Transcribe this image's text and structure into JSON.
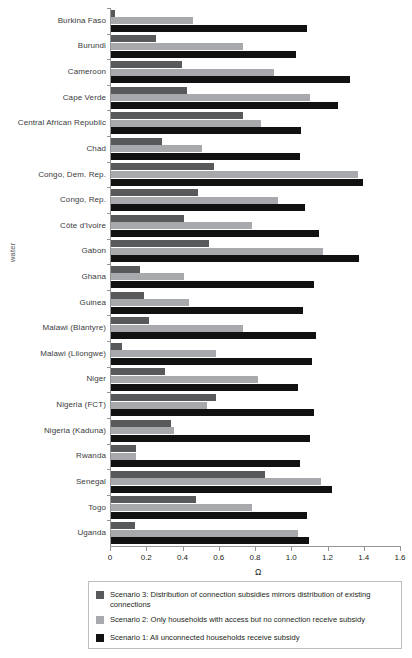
{
  "chart_data": {
    "type": "bar",
    "orientation": "horizontal",
    "grouped": true,
    "title": "",
    "xlabel": "Ω",
    "ylabel": "water",
    "xlim": [
      0,
      1.6
    ],
    "xticks": [
      0,
      0.2,
      0.4,
      0.6,
      0.8,
      1.0,
      1.2,
      1.4,
      1.6
    ],
    "xtick_labels": [
      "0",
      "0.2",
      "0.4",
      "0.6",
      "0.8",
      "1.0",
      "1.2",
      "1.4",
      "1.6"
    ],
    "grid": false,
    "legend_position": "bottom",
    "categories": [
      "Burkina Faso",
      "Burundi",
      "Cameroon",
      "Cape Verde",
      "Central African Republic",
      "Chad",
      "Congo, Dem. Rep.",
      "Congo, Rep.",
      "Côte d'Ivoire",
      "Gabon",
      "Ghana",
      "Guinea",
      "Malawi (Blantyre)",
      "Malawi (Lilongwe)",
      "Niger",
      "Nigeria (FCT)",
      "Nigeria (Kaduna)",
      "Rwanda",
      "Senegal",
      "Togo",
      "Uganda"
    ],
    "series": [
      {
        "name": "Scenario 3: Distribution of connection subsidies mirrors distribution of existing connections",
        "short_name": "Scenario 3",
        "color": "#58595b",
        "values": [
          0.02,
          0.25,
          0.39,
          0.42,
          0.73,
          0.28,
          0.57,
          0.48,
          0.4,
          0.54,
          0.16,
          0.18,
          0.21,
          0.06,
          0.3,
          0.58,
          0.33,
          0.14,
          0.85,
          0.47,
          0.13
        ]
      },
      {
        "name": "Scenario 2: Only households with access but no connection receive subsidy",
        "short_name": "Scenario 2",
        "color": "#a7a9ac",
        "values": [
          0.45,
          0.73,
          0.9,
          1.1,
          0.83,
          0.5,
          1.36,
          0.92,
          0.78,
          1.17,
          0.4,
          0.43,
          0.73,
          0.58,
          0.81,
          0.53,
          0.35,
          0.14,
          1.16,
          0.78,
          1.03
        ]
      },
      {
        "name": "Scenario 1: All unconnected households receive subsidy",
        "short_name": "Scenario 1",
        "color": "#111111",
        "values": [
          1.08,
          1.02,
          1.32,
          1.25,
          1.05,
          1.04,
          1.39,
          1.07,
          1.15,
          1.37,
          1.12,
          1.06,
          1.13,
          1.11,
          1.03,
          1.12,
          1.1,
          1.04,
          1.22,
          1.08,
          1.09
        ]
      }
    ]
  },
  "legend": {
    "entries": [
      {
        "label": "Scenario 3: Distribution of connection subsidies mirrors distribution of existing connections",
        "color": "#58595b"
      },
      {
        "label": "Scenario 2: Only households with access but no connection receive subsidy",
        "color": "#a7a9ac"
      },
      {
        "label": "Scenario 1: All unconnected households receive subsidy",
        "color": "#111111"
      }
    ]
  }
}
